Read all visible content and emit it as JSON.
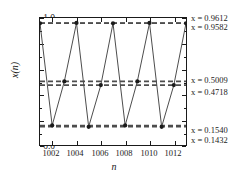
{
  "chart_data": {
    "type": "line",
    "title": "",
    "xlabel": "n",
    "ylabel": "x(n)",
    "xlim": [
      1001,
      1013
    ],
    "ylim": [
      0.0,
      1.0
    ],
    "grid": false,
    "legend": null,
    "marker": "filled-circle",
    "line_color": "#4d4d4d",
    "marker_color": "#1a1a1a",
    "reference_line_color": "#4d4d4d",
    "x_ticks": [
      1002,
      1004,
      1006,
      1008,
      1010,
      1012
    ],
    "x_tick_labels": [
      "1002",
      "1004",
      "1006",
      "1008",
      "1010",
      "1012"
    ],
    "y_ticks": [
      0.0,
      0.2,
      0.4,
      0.6,
      0.8,
      1.0
    ],
    "y_tick_labels": [
      "0.0",
      "0.2",
      "0.4",
      "0.6",
      "0.8",
      "1.0"
    ],
    "x": [
      1001,
      1002,
      1003,
      1004,
      1005,
      1006,
      1007,
      1008,
      1009,
      1010,
      1011,
      1012,
      1013
    ],
    "values": [
      0.9582,
      0.154,
      0.5009,
      0.9612,
      0.1432,
      0.4718,
      0.9582,
      0.154,
      0.5009,
      0.9612,
      0.1432,
      0.4718,
      0.9582
    ],
    "reference_lines": [
      {
        "value": 0.9612,
        "label": "x = 0.9612"
      },
      {
        "value": 0.9582,
        "label": "x = 0.9582"
      },
      {
        "value": 0.5009,
        "label": "x = 0.5009"
      },
      {
        "value": 0.4718,
        "label": "x = 0.4718"
      },
      {
        "value": 0.154,
        "label": "x = 0.1540"
      },
      {
        "value": 0.1432,
        "label": "x = 0.1432"
      }
    ]
  },
  "axes": {
    "y_title": "x(n)",
    "x_title": "n",
    "y_tick_labels": [
      "1.0",
      "0.8",
      "0.6",
      "0.4",
      "0.2",
      "0.0"
    ],
    "x_tick_labels": [
      "1002",
      "1004",
      "1006",
      "1008",
      "1010",
      "1012"
    ]
  },
  "annotations": [
    {
      "eq": "x = 0.9612"
    },
    {
      "eq": "x = 0.9582"
    },
    {
      "eq": "x = 0.5009"
    },
    {
      "eq": "x = 0.4718"
    },
    {
      "eq": "x = 0.1540"
    },
    {
      "eq": "x = 0.1432"
    }
  ]
}
